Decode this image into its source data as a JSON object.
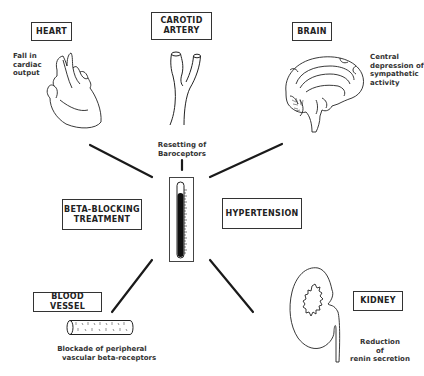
{
  "diagram": {
    "center": {
      "left_box": {
        "line1": "BETA-BLOCKING",
        "line2": "TREATMENT"
      },
      "right_box": {
        "label": "HYPERTENSION"
      },
      "thermometer_icon": "thermometer-icon"
    },
    "nodes": [
      {
        "id": "heart",
        "title": "HEART",
        "icon": "heart-icon",
        "effect_lines": [
          "Fall in",
          "cardiac",
          "output"
        ]
      },
      {
        "id": "carotid",
        "title_line1": "CAROTID",
        "title_line2": "ARTERY",
        "icon": "carotid-artery-icon",
        "effect_lines": [
          "Resetting of",
          "Baroceptors"
        ]
      },
      {
        "id": "brain",
        "title": "BRAIN",
        "icon": "brain-icon",
        "effect_lines": [
          "Central",
          "depression of",
          "sympathetic",
          "activity"
        ]
      },
      {
        "id": "blood_vessel",
        "title": "BLOOD VESSEL",
        "icon": "blood-vessel-icon",
        "effect_lines": [
          "Blockade of peripheral",
          "vascular beta-receptors"
        ]
      },
      {
        "id": "kidney",
        "title": "KIDNEY",
        "icon": "kidney-icon",
        "effect_lines": [
          "Reduction",
          "of",
          "renin secretion"
        ]
      }
    ],
    "colors": {
      "ink": "#222222",
      "background": "#ffffff"
    }
  }
}
